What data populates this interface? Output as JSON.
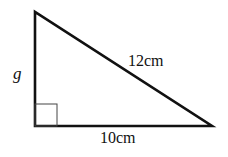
{
  "diagram": {
    "type": "right-triangle",
    "labels": {
      "vertical_side": "g",
      "hypotenuse": "12cm",
      "base": "10cm"
    },
    "right_angle_marker": true,
    "colors": {
      "stroke": "#111111",
      "background": "#ffffff"
    }
  }
}
